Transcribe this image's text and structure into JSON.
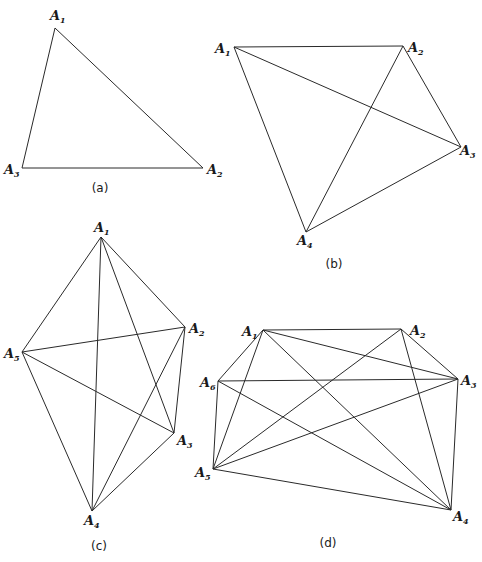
{
  "figure": {
    "background": "#ffffff",
    "stroke_color": "#2a2a2a",
    "panels": [
      {
        "id": "a",
        "caption": "(a)",
        "caption_pos": [
          100,
          192
        ],
        "vertices": [
          {
            "name": "A",
            "sub": "1",
            "x": 55,
            "y": 28,
            "lx": 50,
            "ly": 20
          },
          {
            "name": "A",
            "sub": "2",
            "x": 203,
            "y": 168,
            "lx": 207,
            "ly": 174
          },
          {
            "name": "A",
            "sub": "3",
            "x": 22,
            "y": 168,
            "lx": 4,
            "ly": 174
          }
        ],
        "edges": [
          [
            0,
            1
          ],
          [
            0,
            2
          ],
          [
            1,
            2
          ]
        ]
      },
      {
        "id": "b",
        "caption": "(b)",
        "caption_pos": [
          334,
          268
        ],
        "vertices": [
          {
            "name": "A",
            "sub": "1",
            "x": 234,
            "y": 47,
            "lx": 215,
            "ly": 53
          },
          {
            "name": "A",
            "sub": "2",
            "x": 403,
            "y": 46,
            "lx": 408,
            "ly": 52
          },
          {
            "name": "A",
            "sub": "3",
            "x": 461,
            "y": 147,
            "lx": 460,
            "ly": 155
          },
          {
            "name": "A",
            "sub": "4",
            "x": 306,
            "y": 232,
            "lx": 297,
            "ly": 245
          }
        ],
        "edges": [
          [
            0,
            1
          ],
          [
            0,
            2
          ],
          [
            0,
            3
          ],
          [
            1,
            2
          ],
          [
            1,
            3
          ],
          [
            2,
            3
          ]
        ]
      },
      {
        "id": "c",
        "caption": "(c)",
        "caption_pos": [
          99,
          550
        ],
        "vertices": [
          {
            "name": "A",
            "sub": "1",
            "x": 101,
            "y": 237,
            "lx": 94,
            "ly": 232
          },
          {
            "name": "A",
            "sub": "2",
            "x": 185,
            "y": 327,
            "lx": 189,
            "ly": 333
          },
          {
            "name": "A",
            "sub": "3",
            "x": 174,
            "y": 433,
            "lx": 177,
            "ly": 445
          },
          {
            "name": "A",
            "sub": "4",
            "x": 92,
            "y": 511,
            "lx": 84,
            "ly": 525
          },
          {
            "name": "A",
            "sub": "5",
            "x": 22,
            "y": 352,
            "lx": 4,
            "ly": 358
          }
        ],
        "edges": [
          [
            0,
            1
          ],
          [
            0,
            2
          ],
          [
            0,
            3
          ],
          [
            0,
            4
          ],
          [
            1,
            2
          ],
          [
            1,
            3
          ],
          [
            1,
            4
          ],
          [
            2,
            3
          ],
          [
            2,
            4
          ],
          [
            3,
            4
          ]
        ]
      },
      {
        "id": "d",
        "caption": "(d)",
        "caption_pos": [
          328,
          547
        ],
        "vertices": [
          {
            "name": "A",
            "sub": "1",
            "x": 263,
            "y": 330,
            "lx": 242,
            "ly": 336
          },
          {
            "name": "A",
            "sub": "2",
            "x": 401,
            "y": 329,
            "lx": 410,
            "ly": 335
          },
          {
            "name": "A",
            "sub": "3",
            "x": 458,
            "y": 379,
            "lx": 461,
            "ly": 385
          },
          {
            "name": "A",
            "sub": "4",
            "x": 451,
            "y": 510,
            "lx": 453,
            "ly": 521
          },
          {
            "name": "A",
            "sub": "5",
            "x": 213,
            "y": 469,
            "lx": 195,
            "ly": 477
          },
          {
            "name": "A",
            "sub": "6",
            "x": 218,
            "y": 381,
            "lx": 200,
            "ly": 387
          }
        ],
        "edges": [
          [
            0,
            1
          ],
          [
            0,
            2
          ],
          [
            0,
            3
          ],
          [
            0,
            4
          ],
          [
            0,
            5
          ],
          [
            1,
            2
          ],
          [
            1,
            3
          ],
          [
            1,
            4
          ],
          [
            2,
            3
          ],
          [
            2,
            4
          ],
          [
            2,
            5
          ],
          [
            3,
            4
          ],
          [
            3,
            5
          ],
          [
            4,
            5
          ]
        ]
      }
    ]
  }
}
